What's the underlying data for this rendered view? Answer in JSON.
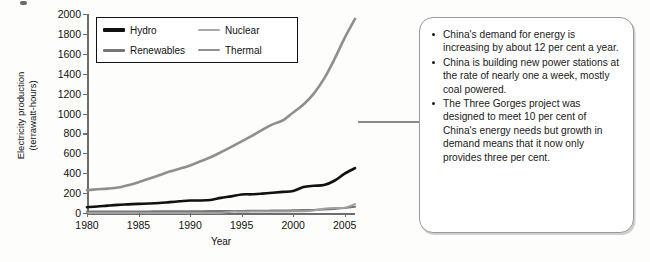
{
  "chart_data": {
    "type": "line",
    "title": "",
    "xlabel": "Year",
    "ylabel": "Electricity production\n(terrawatt-hours)",
    "xlim": [
      1980,
      2006
    ],
    "ylim": [
      0,
      2000
    ],
    "grid": false,
    "legend_position": "top-left-inside",
    "x_ticks": [
      "1980",
      "1985",
      "1990",
      "1995",
      "2000",
      "2005"
    ],
    "x_tick_values": [
      1980,
      1985,
      1990,
      1995,
      2000,
      2005
    ],
    "y_ticks": [
      "0",
      "200",
      "400",
      "600",
      "800",
      "1000",
      "1200",
      "1400",
      "1600",
      "1800",
      "2000"
    ],
    "y_tick_values": [
      0,
      200,
      400,
      600,
      800,
      1000,
      1200,
      1400,
      1600,
      1800,
      2000
    ],
    "x": [
      1980,
      1981,
      1982,
      1983,
      1984,
      1985,
      1986,
      1987,
      1988,
      1989,
      1990,
      1991,
      1992,
      1993,
      1994,
      1995,
      1996,
      1997,
      1998,
      1999,
      2000,
      2001,
      2002,
      2003,
      2004,
      2005,
      2006
    ],
    "series": [
      {
        "name": "Hydro",
        "color": "#111111",
        "width": 2.6,
        "values": [
          58,
          65,
          74,
          82,
          87,
          92,
          95,
          100,
          109,
          118,
          126,
          125,
          131,
          152,
          167,
          186,
          188,
          195,
          204,
          212,
          222,
          261,
          274,
          281,
          324,
          396,
          450
        ]
      },
      {
        "name": "Renewables",
        "color": "#777777",
        "width": 2.0,
        "values": [
          15,
          15,
          15,
          15,
          16,
          16,
          16,
          17,
          17,
          17,
          18,
          18,
          19,
          19,
          20,
          21,
          22,
          23,
          24,
          25,
          27,
          29,
          31,
          34,
          40,
          50,
          62
        ]
      },
      {
        "name": "Nuclear",
        "color": "#a0a0a0",
        "width": 2.0,
        "values": [
          0,
          0,
          0,
          0,
          0,
          0,
          0,
          0,
          0,
          0,
          0,
          0,
          0,
          0,
          13,
          13,
          14,
          14,
          14,
          15,
          17,
          18,
          25,
          43,
          51,
          53,
          90
        ]
      },
      {
        "name": "Thermal",
        "color": "#8f8f8f",
        "width": 2.6,
        "values": [
          230,
          238,
          245,
          256,
          280,
          310,
          344,
          380,
          416,
          445,
          477,
          520,
          560,
          612,
          665,
          720,
          775,
          835,
          890,
          930,
          1010,
          1090,
          1200,
          1350,
          1545,
          1760,
          1950
        ]
      }
    ]
  },
  "legend": {
    "items": [
      {
        "label": "Hydro",
        "color": "#111111",
        "thickness": 4
      },
      {
        "label": "Nuclear",
        "color": "#a8a8a8",
        "thickness": 2.6
      },
      {
        "label": "Renewables",
        "color": "#777777",
        "thickness": 3
      },
      {
        "label": "Thermal",
        "color": "#909090",
        "thickness": 2.8
      }
    ]
  },
  "callout": {
    "bullets": [
      "China's demand for energy is increasing by about 12 per cent a year.",
      "China is building new power stations at the rate of nearly one a week, mostly coal powered.",
      "The Three Gorges project was designed to meet 10 per cent of China's energy needs but growth in demand means that it now only provides three per cent."
    ]
  }
}
